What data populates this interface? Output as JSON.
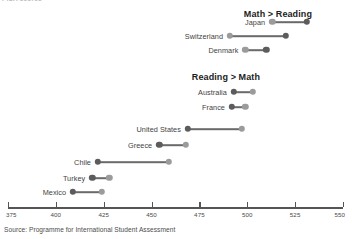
{
  "top_strip": {
    "clipped_title": "PISA scores"
  },
  "chart_data": {
    "type": "scatter",
    "subtype": "dumbbell",
    "title": "",
    "xlabel": "",
    "ylabel": "",
    "xlim": [
      375,
      550
    ],
    "grid": false,
    "legend_position": "none",
    "source": "Source: Programme for International Student Assessment",
    "x_ticks": [
      375,
      400,
      425,
      450,
      475,
      500,
      525,
      550
    ],
    "x_tick_labels": [
      "375",
      "400",
      "425",
      "450",
      "475",
      "500",
      "525",
      "550"
    ],
    "series": [
      {
        "name": "Math",
        "color": "#5c5c5c"
      },
      {
        "name": "Reading",
        "color": "#9b9b9b"
      }
    ],
    "groups": [
      {
        "header": "Math > Reading",
        "categories": [
          "Japan",
          "Switzerland",
          "Denmark"
        ],
        "rows": [
          {
            "label": "Japan",
            "math": 531,
            "reading": 513
          },
          {
            "label": "Switzerland",
            "math": 520,
            "reading": 491
          },
          {
            "label": "Denmark",
            "math": 510,
            "reading": 499
          }
        ]
      },
      {
        "header": "Reading > Math",
        "categories": [
          "Australia",
          "France",
          "United States",
          "Greece",
          "Chile",
          "Turkey",
          "Mexico"
        ],
        "rows": [
          {
            "label": "Australia",
            "math": 493,
            "reading": 503
          },
          {
            "label": "France",
            "math": 492,
            "reading": 499
          },
          {
            "label": "United States",
            "math": 469,
            "reading": 497
          },
          {
            "label": "Greece",
            "math": 454,
            "reading": 468
          },
          {
            "label": "Chile",
            "math": 422,
            "reading": 459
          },
          {
            "label": "Turkey",
            "math": 419,
            "reading": 428
          },
          {
            "label": "Mexico",
            "math": 409,
            "reading": 424
          }
        ]
      }
    ]
  },
  "layout": {
    "axis_x_left": 8,
    "axis_x_right": 343,
    "axis_y": 207,
    "tick_height": 5,
    "tick_label_y": 211,
    "group_header_y": [
      9,
      72
    ],
    "row_y": [
      22,
      36,
      50,
      92,
      107,
      129,
      145,
      162,
      178,
      192
    ],
    "label_gap": 7
  }
}
